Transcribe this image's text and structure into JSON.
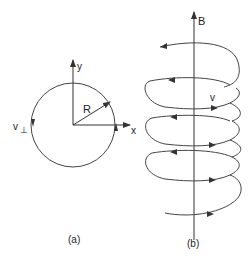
{
  "panel_a": {
    "caption": "(a)",
    "labels": {
      "y_axis": "y",
      "x_axis": "x",
      "radius": "R",
      "v_perp": "v",
      "v_perp_sub": "⊥"
    }
  },
  "panel_b": {
    "caption": "(b)",
    "labels": {
      "field": "B",
      "velocity": "v"
    }
  },
  "colors": {
    "stroke": "#333333",
    "background": "#ffffff"
  }
}
